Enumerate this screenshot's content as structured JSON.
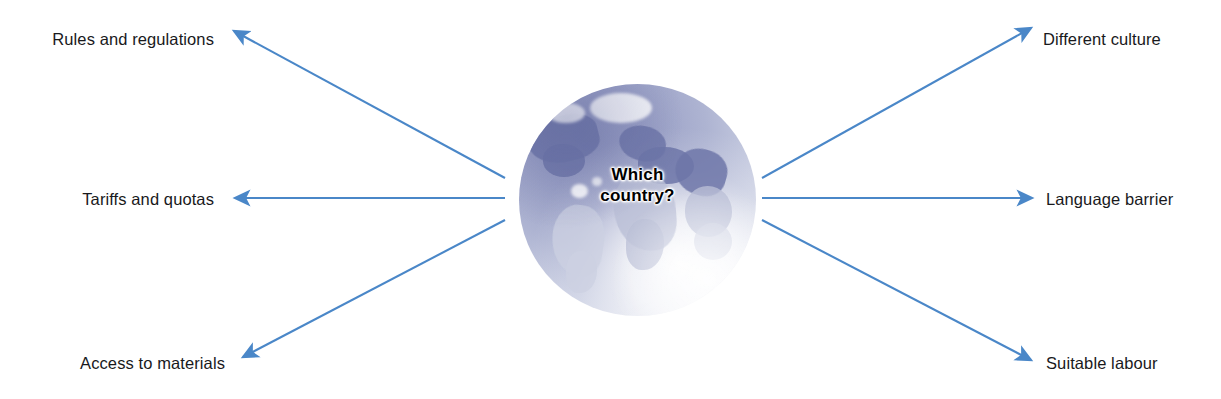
{
  "diagram": {
    "title": "Which country?",
    "center": {
      "icon": "globe-icon",
      "line1": "Which",
      "line2": "country?"
    },
    "arrow_color": "#4a87c8",
    "label_color": "#19191c",
    "background_color": "#ffffff",
    "left_branches": [
      {
        "label": "Rules and regulations"
      },
      {
        "label": "Tariffs and quotas"
      },
      {
        "label": "Access to materials"
      }
    ],
    "right_branches": [
      {
        "label": "Different culture"
      },
      {
        "label": "Language barrier"
      },
      {
        "label": "Suitable labour"
      }
    ]
  }
}
